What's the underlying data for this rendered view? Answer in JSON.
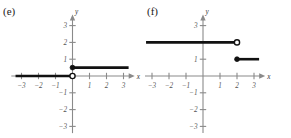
{
  "figure": {
    "width": 291,
    "height": 138,
    "background": "#ffffff",
    "line_color": "#111111",
    "axis_color": "#8a8a8a"
  },
  "panels": [
    {
      "id": "e",
      "label": "(e)",
      "axis_x_label": "x",
      "axis_y_label": "y",
      "x_ticks": [
        -3,
        -2,
        -1,
        1,
        2,
        3
      ],
      "y_ticks": [
        3,
        2,
        1,
        -1,
        -2,
        -3
      ],
      "x_tick_labels": [
        "−3",
        "−2",
        "−1",
        "1",
        "2",
        "3"
      ],
      "y_tick_labels": [
        "3",
        "2",
        "1",
        "−1",
        "−2",
        "−3"
      ],
      "chart_data": {
        "type": "line",
        "title": "(e)",
        "xlabel": "x",
        "ylabel": "y",
        "xlim": [
          -3.6,
          3.6
        ],
        "ylim": [
          -3.4,
          3.6
        ],
        "grid": false,
        "legend": "none",
        "description": "Piecewise step function: y = 0 for x < 0 (open endpoint at origin), y = 0.5 for x >= 0 (closed endpoint)",
        "segments": [
          {
            "name": "left-branch",
            "x_start": -3.35,
            "y_start": 0,
            "x_end": 0,
            "y_end": 0,
            "endpoint_left": "none",
            "endpoint_right": "open"
          },
          {
            "name": "right-branch",
            "x_start": 0,
            "y_start": 0.5,
            "x_end": 3.3,
            "y_end": 0.5,
            "endpoint_left": "closed",
            "endpoint_right": "none"
          }
        ],
        "points": [
          {
            "name": "open-endpoint-origin",
            "x": 0,
            "y": 0,
            "style": "open"
          },
          {
            "name": "closed-endpoint-half",
            "x": 0,
            "y": 0.5,
            "style": "closed"
          }
        ]
      }
    },
    {
      "id": "f",
      "label": "(f)",
      "axis_x_label": "x",
      "axis_y_label": "y",
      "x_ticks": [
        -3,
        -2,
        -1,
        1,
        2,
        3
      ],
      "y_ticks": [
        3,
        1,
        -1,
        -2,
        -3
      ],
      "x_tick_labels": [
        "−3",
        "−2",
        "−1",
        "1",
        "2",
        "3"
      ],
      "y_tick_labels": [
        "3",
        "1",
        "−1",
        "−2",
        "−3"
      ],
      "chart_data": {
        "type": "line",
        "title": "(f)",
        "xlabel": "x",
        "ylabel": "y",
        "xlim": [
          -3.6,
          3.6
        ],
        "ylim": [
          -3.4,
          3.6
        ],
        "grid": false,
        "legend": "none",
        "description": "Piecewise step function: y = 2 for x < 2 (open endpoint at (2,2)), y = 1 for x >= 2 (closed endpoint at (2,1))",
        "segments": [
          {
            "name": "upper-branch",
            "x_start": -3.35,
            "y_start": 2,
            "x_end": 2,
            "y_end": 2,
            "endpoint_left": "none",
            "endpoint_right": "open"
          },
          {
            "name": "lower-branch",
            "x_start": 2,
            "y_start": 1,
            "x_end": 3.3,
            "y_end": 1,
            "endpoint_left": "closed",
            "endpoint_right": "none"
          }
        ],
        "points": [
          {
            "name": "open-endpoint-upper",
            "x": 2,
            "y": 2,
            "style": "open"
          },
          {
            "name": "closed-endpoint-lower",
            "x": 2,
            "y": 1,
            "style": "closed"
          }
        ]
      }
    }
  ]
}
